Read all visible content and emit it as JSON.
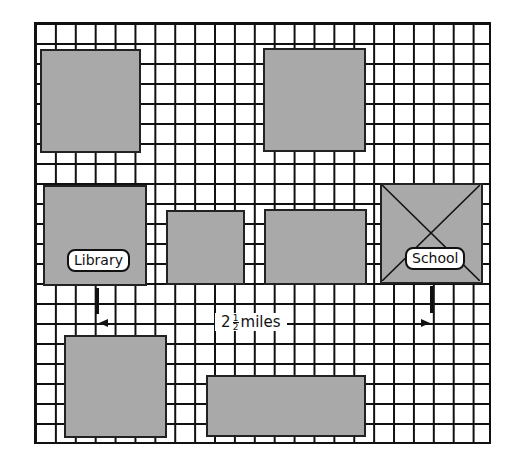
{
  "diagram": {
    "type": "street-grid-map",
    "grid": {
      "columns": 23,
      "rows": 21
    },
    "colors": {
      "block_fill": "#a9a9a9",
      "grid_line": "#111111",
      "background": "#ffffff"
    },
    "blocks": [
      {
        "id": "block-top-left"
      },
      {
        "id": "block-top-right"
      },
      {
        "id": "block-library",
        "label": "Library"
      },
      {
        "id": "block-middle-small"
      },
      {
        "id": "block-middle-wide"
      },
      {
        "id": "block-school",
        "label": "School",
        "marked": "x-crossed"
      },
      {
        "id": "block-bottom-left"
      },
      {
        "id": "block-bottom-wide"
      }
    ],
    "distance": {
      "whole": "2",
      "numerator": "1",
      "denominator": "2",
      "unit": "miles",
      "from": "Library",
      "to": "School"
    }
  }
}
